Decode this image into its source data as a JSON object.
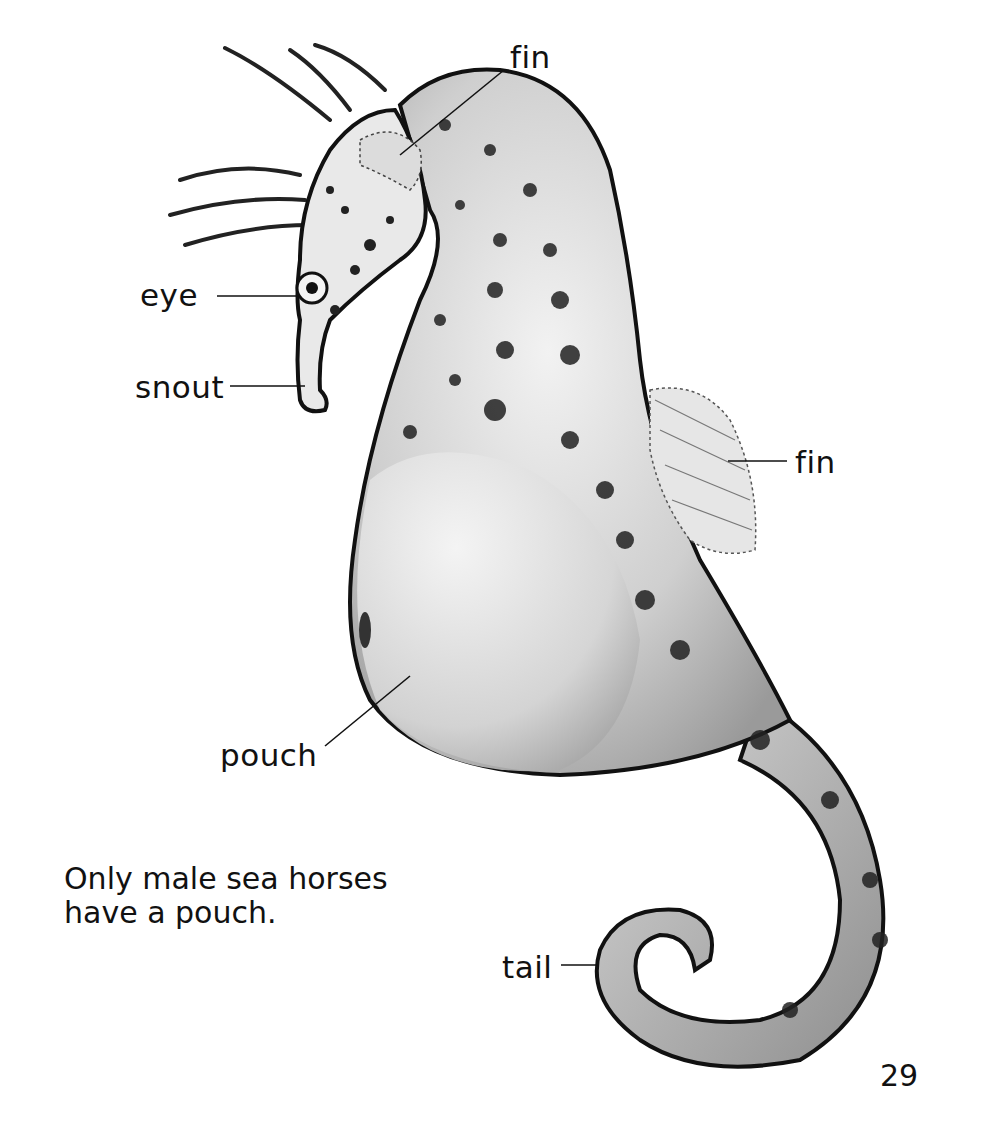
{
  "diagram": {
    "subject": "sea horse",
    "labels": [
      {
        "id": "fin_top",
        "text": "fin"
      },
      {
        "id": "eye",
        "text": "eye"
      },
      {
        "id": "snout",
        "text": "snout"
      },
      {
        "id": "fin_back",
        "text": "fin"
      },
      {
        "id": "pouch",
        "text": "pouch"
      },
      {
        "id": "tail",
        "text": "tail"
      }
    ]
  },
  "caption": {
    "line1": "Only male sea horses",
    "line2": "have a pouch."
  },
  "page_number": "29"
}
